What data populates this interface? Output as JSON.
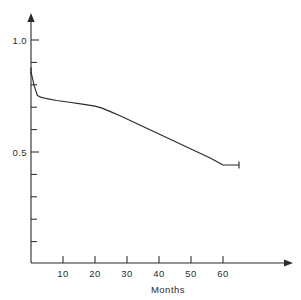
{
  "chart_data": {
    "type": "line",
    "title": "",
    "subtitle": "",
    "xlabel": "Months",
    "ylabel": "",
    "xlim": [
      0,
      68
    ],
    "ylim": [
      0,
      1.08
    ],
    "grid": false,
    "legend": null,
    "x_ticks_major": [
      10,
      20,
      30,
      40,
      50,
      60
    ],
    "x_tick_labels": [
      "10",
      "20",
      "30",
      "40",
      "50",
      "60"
    ],
    "y_ticks_major": [
      1.0,
      0.5
    ],
    "y_tick_labels": [
      "1.0",
      "0.5"
    ],
    "y_ticks_minor": [
      0.9,
      0.8,
      0.7,
      0.6,
      0.4,
      0.3,
      0.2,
      0.1
    ],
    "series": [
      {
        "name": "survival",
        "x": [
          0,
          1,
          2,
          3,
          5,
          8,
          12,
          16,
          20,
          22,
          25,
          28,
          32,
          36,
          40,
          44,
          48,
          52,
          56,
          60,
          65
        ],
        "y": [
          0.858,
          0.795,
          0.752,
          0.745,
          0.738,
          0.73,
          0.722,
          0.714,
          0.705,
          0.697,
          0.679,
          0.661,
          0.634,
          0.607,
          0.58,
          0.554,
          0.527,
          0.5,
          0.473,
          0.442,
          0.442
        ]
      }
    ],
    "censor_marks": [
      {
        "x": 0,
        "y": 0.862
      },
      {
        "x": 65,
        "y": 0.442
      }
    ],
    "annotations": []
  },
  "axes": {
    "y_axis_name": "probability-axis",
    "x_axis_name": "months-axis",
    "x_axis_title": "Months"
  },
  "colors": {
    "ink": "#2b2b2b",
    "background": "#ffffff",
    "curve": "#2b2b2b"
  }
}
